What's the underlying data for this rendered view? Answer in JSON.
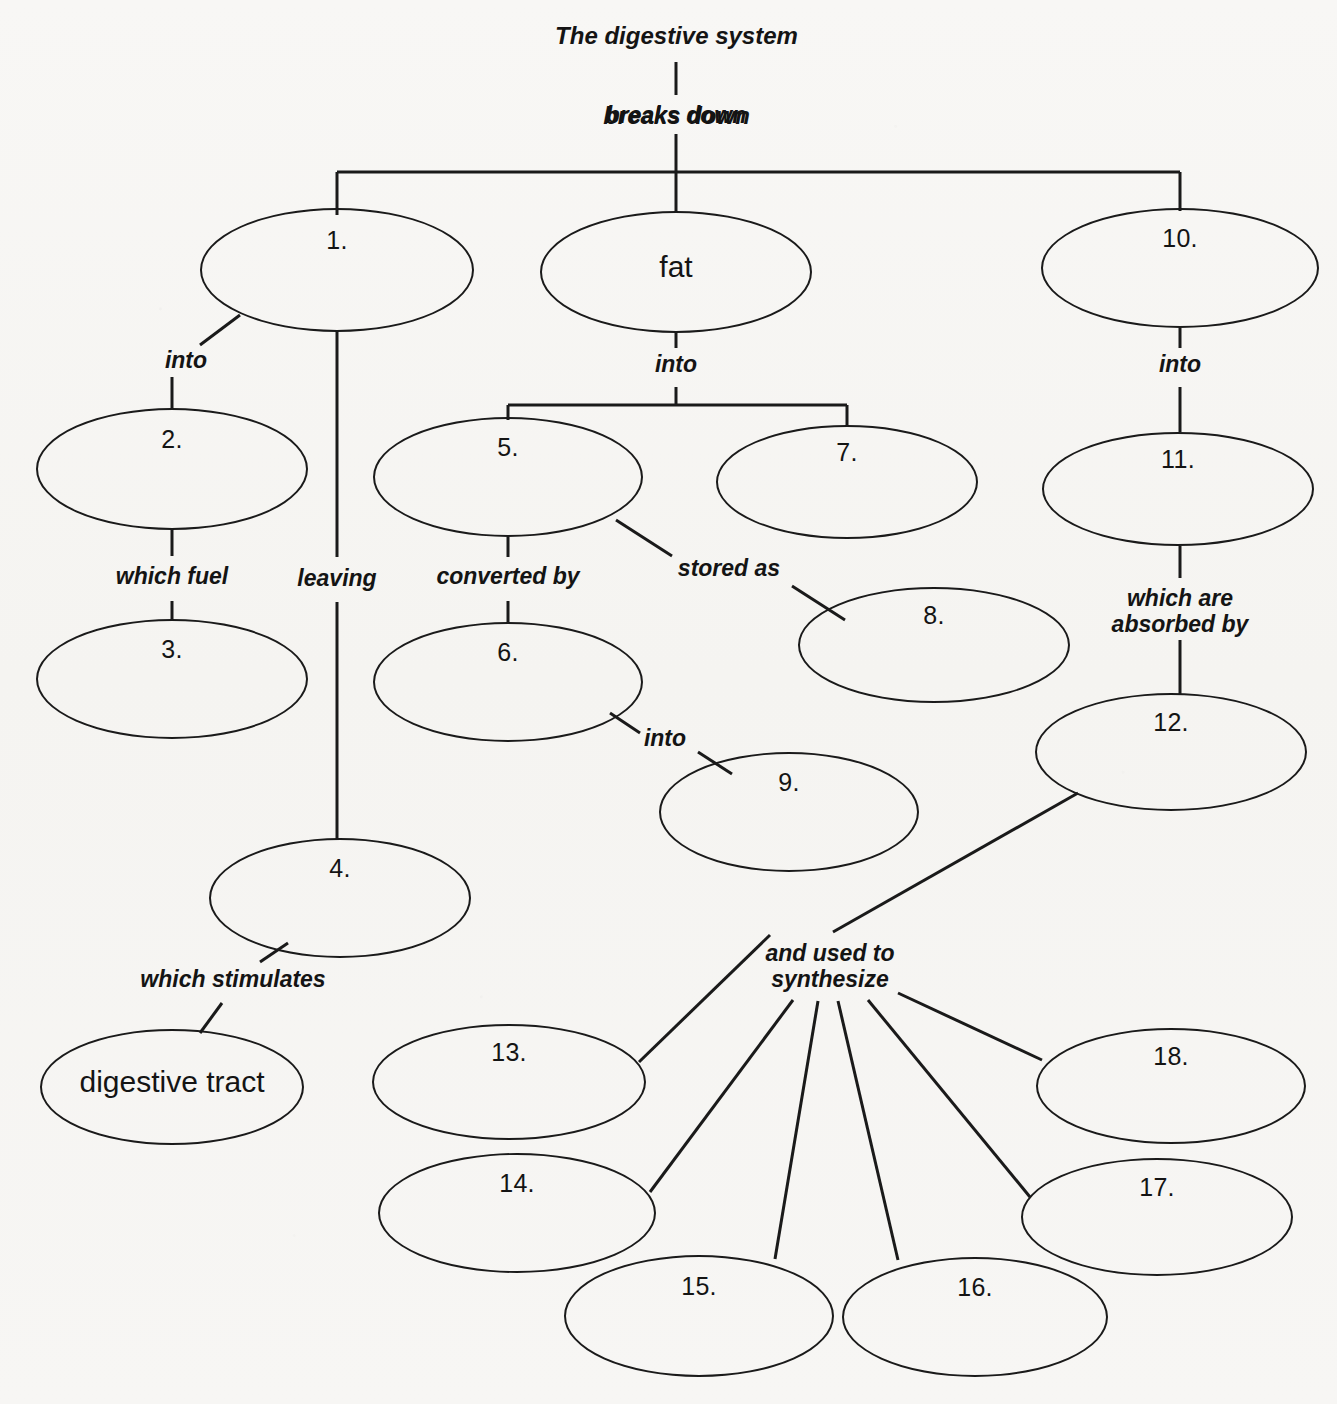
{
  "diagram": {
    "type": "concept-map",
    "title": "The digestive system",
    "root": {
      "label": "The digestive system",
      "relation": "breaks down"
    },
    "nodes": [
      {
        "id": "n1",
        "label": "1.",
        "cx": 337,
        "cy": 270,
        "rx": 137,
        "ry": 62,
        "label_dy": -31
      },
      {
        "id": "fat",
        "label": "fat",
        "cx": 676,
        "cy": 272,
        "rx": 136,
        "ry": 61,
        "label_dy": -6
      },
      {
        "id": "n10",
        "label": "10.",
        "cx": 1180,
        "cy": 268,
        "rx": 139,
        "ry": 60,
        "label_dy": -31
      },
      {
        "id": "n2",
        "label": "2.",
        "cx": 172,
        "cy": 469,
        "rx": 136,
        "ry": 61,
        "label_dy": -31
      },
      {
        "id": "n5",
        "label": "5.",
        "cx": 508,
        "cy": 477,
        "rx": 135,
        "ry": 60,
        "label_dy": -31
      },
      {
        "id": "n7",
        "label": "7.",
        "cx": 847,
        "cy": 482,
        "rx": 131,
        "ry": 57,
        "label_dy": -31
      },
      {
        "id": "n11",
        "label": "11.",
        "cx": 1178,
        "cy": 489,
        "rx": 136,
        "ry": 57,
        "label_dy": -31
      },
      {
        "id": "n3",
        "label": "3.",
        "cx": 172,
        "cy": 679,
        "rx": 136,
        "ry": 60,
        "label_dy": -31
      },
      {
        "id": "n6",
        "label": "6.",
        "cx": 508,
        "cy": 682,
        "rx": 135,
        "ry": 60,
        "label_dy": -31
      },
      {
        "id": "n8",
        "label": "8.",
        "cx": 934,
        "cy": 645,
        "rx": 136,
        "ry": 58,
        "label_dy": -31
      },
      {
        "id": "n12",
        "label": "12.",
        "cx": 1171,
        "cy": 752,
        "rx": 136,
        "ry": 59,
        "label_dy": -31
      },
      {
        "id": "n9",
        "label": "9.",
        "cx": 789,
        "cy": 812,
        "rx": 130,
        "ry": 60,
        "label_dy": -31
      },
      {
        "id": "n4",
        "label": "4.",
        "cx": 340,
        "cy": 898,
        "rx": 131,
        "ry": 60,
        "label_dy": -31
      },
      {
        "id": "dt",
        "label": "digestive tract",
        "cx": 172,
        "cy": 1087,
        "rx": 132,
        "ry": 58,
        "label_dy": -6
      },
      {
        "id": "n13",
        "label": "13.",
        "cx": 509,
        "cy": 1082,
        "rx": 137,
        "ry": 58,
        "label_dy": -31
      },
      {
        "id": "n18",
        "label": "18.",
        "cx": 1171,
        "cy": 1086,
        "rx": 135,
        "ry": 58,
        "label_dy": -31
      },
      {
        "id": "n14",
        "label": "14.",
        "cx": 517,
        "cy": 1213,
        "rx": 139,
        "ry": 60,
        "label_dy": -31
      },
      {
        "id": "n17",
        "label": "17.",
        "cx": 1157,
        "cy": 1217,
        "rx": 136,
        "ry": 59,
        "label_dy": -31
      },
      {
        "id": "n15",
        "label": "15.",
        "cx": 699,
        "cy": 1316,
        "rx": 135,
        "ry": 61,
        "label_dy": -31
      },
      {
        "id": "n16",
        "label": "16.",
        "cx": 975,
        "cy": 1317,
        "rx": 133,
        "ry": 60,
        "label_dy": -31
      }
    ],
    "link_labels": [
      {
        "id": "l_breaks_down",
        "text": "breaks down",
        "x": 676,
        "y": 117,
        "lines": 1
      },
      {
        "id": "l_into_1",
        "text": "into",
        "x": 186,
        "y": 362,
        "lines": 1
      },
      {
        "id": "l_into_fat",
        "text": "into",
        "x": 676,
        "y": 366,
        "lines": 1
      },
      {
        "id": "l_into_10",
        "text": "into",
        "x": 1180,
        "y": 366,
        "lines": 1
      },
      {
        "id": "l_which_fuel",
        "text": "which fuel",
        "x": 172,
        "y": 578,
        "lines": 1
      },
      {
        "id": "l_leaving",
        "text": "leaving",
        "x": 337,
        "y": 580,
        "lines": 1
      },
      {
        "id": "l_converted",
        "text": "converted by",
        "x": 508,
        "y": 578,
        "lines": 1
      },
      {
        "id": "l_stored_as",
        "text": "stored as",
        "x": 729,
        "y": 570,
        "lines": 1
      },
      {
        "id": "l_absorbed",
        "text": "which are\nabsorbed by",
        "x": 1180,
        "y": 612,
        "lines": 2
      },
      {
        "id": "l_into_6",
        "text": "into",
        "x": 665,
        "y": 740,
        "lines": 1
      },
      {
        "id": "l_stimulates",
        "text": "which stimulates",
        "x": 233,
        "y": 981,
        "lines": 1
      },
      {
        "id": "l_synthesize",
        "text": "and used to\nsynthesize",
        "x": 830,
        "y": 967,
        "lines": 2
      }
    ],
    "edges": [
      {
        "id": "e-root-stem-top",
        "from": "The digestive system",
        "to": "breaks down",
        "kind": "vertical"
      },
      {
        "id": "e-root-stem-bottom",
        "from": "breaks down",
        "to": "split-bar",
        "kind": "vertical"
      },
      {
        "id": "e-split-bar-top",
        "from": "split-bar",
        "to": "1 / fat / 10",
        "kind": "bracket"
      },
      {
        "id": "e-1-into-2",
        "from": "1.",
        "to": "2.",
        "kind": "diagonal"
      },
      {
        "id": "e-1-leaving-4",
        "from": "1.",
        "to": "4.",
        "kind": "vertical"
      },
      {
        "id": "e-2-fuel-3",
        "from": "2.",
        "to": "3.",
        "kind": "vertical"
      },
      {
        "id": "e-fat-into-split",
        "from": "fat",
        "to": "5. / 7.",
        "kind": "bracket"
      },
      {
        "id": "e-5-converted-6",
        "from": "5.",
        "to": "6.",
        "kind": "vertical"
      },
      {
        "id": "e-5-stored-8",
        "from": "5.",
        "to": "8.",
        "kind": "diagonal"
      },
      {
        "id": "e-6-into-9",
        "from": "6.",
        "to": "9.",
        "kind": "diagonal"
      },
      {
        "id": "e-10-into-11",
        "from": "10.",
        "to": "11.",
        "kind": "vertical"
      },
      {
        "id": "e-11-absorbed-12",
        "from": "11.",
        "to": "12.",
        "kind": "vertical"
      },
      {
        "id": "e-4-stimulates-dt",
        "from": "4.",
        "to": "digestive tract",
        "kind": "diagonal"
      },
      {
        "id": "e-12-synth-hub",
        "from": "12.",
        "to": "and used to synthesize",
        "kind": "diagonal"
      },
      {
        "id": "e-hub-13",
        "from": "and used to synthesize",
        "to": "13.",
        "kind": "diagonal"
      },
      {
        "id": "e-hub-14",
        "from": "and used to synthesize",
        "to": "14.",
        "kind": "diagonal"
      },
      {
        "id": "e-hub-15",
        "from": "and used to synthesize",
        "to": "15.",
        "kind": "diagonal"
      },
      {
        "id": "e-hub-16",
        "from": "and used to synthesize",
        "to": "16.",
        "kind": "diagonal"
      },
      {
        "id": "e-hub-17",
        "from": "and used to synthesize",
        "to": "17.",
        "kind": "diagonal"
      },
      {
        "id": "e-hub-18",
        "from": "and used to synthesize",
        "to": "18.",
        "kind": "diagonal"
      }
    ],
    "colors": {
      "stroke": "#1a1a1a",
      "text": "#141414",
      "paper": "#f7f6f4"
    }
  }
}
